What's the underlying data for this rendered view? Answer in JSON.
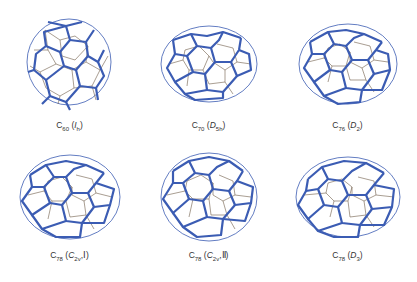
{
  "figure": {
    "line_colors": {
      "bold_edges": "#3b5cb3",
      "thin_edges": "#6e5d48"
    },
    "molecules": [
      {
        "formula": "C",
        "subscript": "60",
        "symmetry_main": "I",
        "symmetry_sub": "h",
        "symmetry_suffix": "",
        "label_text": "C60 (Ih)"
      },
      {
        "formula": "C",
        "subscript": "70",
        "symmetry_main": "D",
        "symmetry_sub": "5h",
        "symmetry_suffix": "",
        "label_text": "C70 (D5h)"
      },
      {
        "formula": "C",
        "subscript": "76",
        "symmetry_main": "D",
        "symmetry_sub": "2",
        "symmetry_suffix": "",
        "label_text": "C76 (D2)"
      },
      {
        "formula": "C",
        "subscript": "78",
        "symmetry_main": "C",
        "symmetry_sub": "2v",
        "symmetry_suffix": "Ⅰ",
        "label_text": "C78 (C2v Ⅰ)"
      },
      {
        "formula": "C",
        "subscript": "78",
        "symmetry_main": "C",
        "symmetry_sub": "2v",
        "symmetry_suffix": "Ⅱ",
        "label_text": "C78 (C2v Ⅱ)"
      },
      {
        "formula": "C",
        "subscript": "78",
        "symmetry_main": "D",
        "symmetry_sub": "3",
        "symmetry_suffix": "",
        "label_text": "C78 (D3)"
      }
    ],
    "caption_clipped": ""
  }
}
